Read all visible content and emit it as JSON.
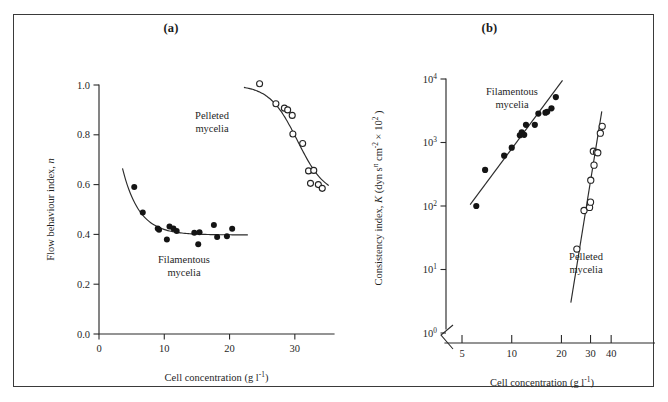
{
  "figure": {
    "panels": [
      {
        "id": "a",
        "title": "(a)",
        "xaxis": {
          "label": "Cell concentration (g l",
          "label_exp": "-1",
          "label_tail": ")",
          "scale": "linear",
          "ticks": [
            "0",
            "10",
            "20",
            "30"
          ],
          "tick_values": [
            0,
            10,
            20,
            30
          ],
          "range": [
            0,
            36
          ]
        },
        "yaxis": {
          "label": "Flow behaviour index, ",
          "label_italic": "n",
          "scale": "linear",
          "ticks": [
            "0.0",
            "0.2",
            "0.4",
            "0.6",
            "0.8",
            "1.0"
          ],
          "tick_values": [
            0.0,
            0.2,
            0.4,
            0.6,
            0.8,
            1.0
          ],
          "range": [
            0,
            1
          ]
        },
        "annotations": [
          {
            "name": "pelleted-mycelia-label",
            "line1": "Pelleted",
            "line2": "mycelia"
          },
          {
            "name": "filamentous-mycelia-label",
            "line1": "Filamentous",
            "line2": "mycelia"
          }
        ]
      },
      {
        "id": "b",
        "title": "(b)",
        "xaxis": {
          "label": "Cell concentration (g l",
          "label_exp": "-1",
          "label_tail": ")",
          "scale": "log",
          "ticks": [
            "5",
            "10",
            "20",
            "30",
            "40"
          ],
          "tick_values": [
            5,
            10,
            20,
            30,
            40
          ],
          "range": [
            4,
            55
          ]
        },
        "yaxis": {
          "label_a": "Consistency index, ",
          "label_italic": "K",
          "label_b": " (dyn s",
          "label_sup1": "n",
          "label_c": " cm",
          "label_sup2": "-2",
          "label_d": " × 10",
          "label_sup3": "2",
          "label_e": " )",
          "scale": "log",
          "ticks": [
            "10",
            "10",
            "10",
            "10",
            "10"
          ],
          "tick_exponents": [
            "0",
            "1",
            "2",
            "3",
            "4"
          ],
          "tick_values": [
            1,
            10,
            100,
            1000,
            10000
          ],
          "range": [
            1,
            10000
          ],
          "axis_break": true
        },
        "annotations": [
          {
            "name": "filamentous-mycelia-label",
            "line1": "Filamentous",
            "line2": "mycelia"
          },
          {
            "name": "pelleted-mycelia-label",
            "line1": "Pelleted",
            "line2": "mycelia"
          }
        ]
      }
    ]
  },
  "chart_data": [
    {
      "type": "scatter",
      "panel": "a",
      "title": "(a)",
      "xlabel": "Cell concentration (g l-1)",
      "ylabel": "Flow behaviour index, n",
      "xscale": "linear",
      "yscale": "linear",
      "xlim": [
        0,
        36
      ],
      "ylim": [
        0,
        1
      ],
      "xticks": [
        0,
        10,
        20,
        30
      ],
      "yticks": [
        0.0,
        0.2,
        0.4,
        0.6,
        0.8,
        1.0
      ],
      "grid": false,
      "legend": "inline-annotations",
      "series": [
        {
          "name": "Filamentous mycelia",
          "marker": "filled-circle",
          "points": [
            [
              5.4,
              0.59
            ],
            [
              6.7,
              0.488
            ],
            [
              9.0,
              0.424
            ],
            [
              9.2,
              0.419
            ],
            [
              10.4,
              0.38
            ],
            [
              10.8,
              0.432
            ],
            [
              11.4,
              0.424
            ],
            [
              11.9,
              0.414
            ],
            [
              14.6,
              0.407
            ],
            [
              15.2,
              0.36
            ],
            [
              15.4,
              0.409
            ],
            [
              17.6,
              0.438
            ],
            [
              18.1,
              0.39
            ],
            [
              19.6,
              0.393
            ],
            [
              20.4,
              0.423
            ]
          ],
          "fit": {
            "description": "exponential decay to plateau n = 0.40",
            "x_start": 3.6,
            "x_end": 22.8,
            "y_start": 0.665,
            "plateau": 0.398
          }
        },
        {
          "name": "Pelleted mycelia",
          "marker": "open-circle",
          "points": [
            [
              24.6,
              1.005
            ],
            [
              27.1,
              0.925
            ],
            [
              28.4,
              0.907
            ],
            [
              28.9,
              0.9
            ],
            [
              29.6,
              0.878
            ],
            [
              29.7,
              0.803
            ],
            [
              31.2,
              0.765
            ],
            [
              32.1,
              0.655
            ],
            [
              32.4,
              0.605
            ],
            [
              32.9,
              0.657
            ],
            [
              33.6,
              0.6
            ],
            [
              34.2,
              0.585
            ]
          ],
          "fit": {
            "description": "sigmoid declining from plateau 1.0",
            "x_start": 22.2,
            "x_end": 35.2,
            "plateau": 1.0,
            "y_end": 0.553
          }
        }
      ]
    },
    {
      "type": "scatter",
      "panel": "b",
      "title": "(b)",
      "xlabel": "Cell concentration (g l-1)",
      "ylabel": "Consistency index, K (dyn s^n cm^-2 x 10^2)",
      "xscale": "log",
      "yscale": "log",
      "xlim": [
        4,
        55
      ],
      "ylim": [
        1,
        10000
      ],
      "xticks": [
        5,
        10,
        20,
        30,
        40
      ],
      "yticks": [
        1,
        10,
        100,
        1000,
        10000
      ],
      "grid": false,
      "legend": "inline-annotations",
      "series": [
        {
          "name": "Filamentous mycelia",
          "marker": "filled-circle",
          "points": [
            [
              6.1,
              100
            ],
            [
              6.9,
              370
            ],
            [
              9.0,
              620
            ],
            [
              10.0,
              830
            ],
            [
              11.2,
              1300
            ],
            [
              11.5,
              1450
            ],
            [
              11.9,
              1320
            ],
            [
              12.2,
              1900
            ],
            [
              13.8,
              1900
            ],
            [
              14.5,
              2850
            ],
            [
              16.0,
              2950
            ],
            [
              16.4,
              3050
            ],
            [
              17.4,
              3450
            ],
            [
              18.5,
              5200
            ]
          ],
          "fit": {
            "description": "power-law straight line on log-log",
            "x_start": 5.6,
            "x_end": 20.3,
            "y_start": 105,
            "y_end": 9500
          }
        },
        {
          "name": "Pelleted mycelia",
          "marker": "open-circle",
          "points": [
            [
              24.8,
              21
            ],
            [
              27.4,
              85
            ],
            [
              29.6,
              95
            ],
            [
              30.0,
              115
            ],
            [
              30.1,
              255
            ],
            [
              31.2,
              730
            ],
            [
              31.5,
              440
            ],
            [
              32.6,
              700
            ],
            [
              33.2,
              690
            ],
            [
              34.4,
              1400
            ],
            [
              35.3,
              1800
            ]
          ],
          "fit": {
            "description": "power-law straight line on log-log, steeper",
            "x_start": 22.8,
            "x_end": 35.1,
            "y_start": 3.0,
            "y_end": 3100
          }
        }
      ]
    }
  ]
}
